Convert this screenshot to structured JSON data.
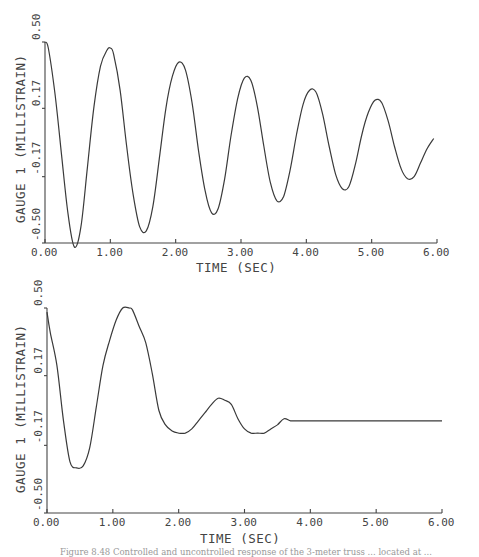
{
  "chart_data": [
    {
      "type": "line",
      "title": "",
      "xlabel": "TIME  (SEC)",
      "ylabel": "GAUGE 1  (MILLISTRAIN)",
      "xlim": [
        0,
        6
      ],
      "ylim": [
        -0.5,
        0.5
      ],
      "xticks": [
        "0.00",
        "1.00",
        "2.00",
        "3.00",
        "4.00",
        "5.00",
        "6.00"
      ],
      "yticks": [
        "-0.50",
        "-0.17",
        "0.17",
        "0.50"
      ],
      "grid": false,
      "legend": null,
      "description": "Uncontrolled response: lightly damped oscillation, period ~1.05 s",
      "series": [
        {
          "name": "Gauge 1 (uncontrolled)",
          "x": [
            0.0,
            0.05,
            0.15,
            0.25,
            0.35,
            0.45,
            0.55,
            0.65,
            0.75,
            0.85,
            0.95,
            1.0,
            1.05,
            1.15,
            1.25,
            1.35,
            1.45,
            1.55,
            1.65,
            1.75,
            1.85,
            1.95,
            2.05,
            2.15,
            2.25,
            2.35,
            2.45,
            2.55,
            2.65,
            2.75,
            2.85,
            2.95,
            3.05,
            3.15,
            3.25,
            3.35,
            3.45,
            3.55,
            3.65,
            3.75,
            3.85,
            3.95,
            4.05,
            4.15,
            4.25,
            4.35,
            4.45,
            4.55,
            4.65,
            4.75,
            4.85,
            4.95,
            5.05,
            5.15,
            5.25,
            5.35,
            5.45,
            5.55,
            5.65,
            5.75,
            5.85,
            5.95
          ],
          "values": [
            0.5,
            0.47,
            0.25,
            -0.05,
            -0.35,
            -0.52,
            -0.42,
            -0.12,
            0.18,
            0.38,
            0.46,
            0.47,
            0.44,
            0.26,
            -0.02,
            -0.26,
            -0.42,
            -0.44,
            -0.32,
            -0.08,
            0.17,
            0.33,
            0.4,
            0.36,
            0.2,
            -0.04,
            -0.24,
            -0.35,
            -0.33,
            -0.18,
            0.04,
            0.22,
            0.32,
            0.31,
            0.18,
            -0.02,
            -0.2,
            -0.29,
            -0.27,
            -0.14,
            0.04,
            0.19,
            0.26,
            0.25,
            0.14,
            -0.02,
            -0.16,
            -0.23,
            -0.22,
            -0.11,
            0.04,
            0.15,
            0.21,
            0.2,
            0.11,
            -0.02,
            -0.13,
            -0.18,
            -0.17,
            -0.1,
            -0.03,
            0.02
          ]
        }
      ]
    },
    {
      "type": "line",
      "title": "",
      "xlabel": "TIME  (SEC)",
      "ylabel": "GAUGE 1  (MILLISTRAIN)",
      "xlim": [
        0,
        6
      ],
      "ylim": [
        -0.5,
        0.5
      ],
      "xticks": [
        "0.00",
        "1.00",
        "2.00",
        "3.00",
        "4.00",
        "5.00",
        "6.00"
      ],
      "yticks": [
        "-0.50",
        "-0.17",
        "0.17",
        "0.50"
      ],
      "grid": false,
      "legend": null,
      "description": "Controlled response: oscillation suppressed, settles near -0.05 after ~3.6 s",
      "series": [
        {
          "name": "Gauge 1 (controlled)",
          "x": [
            0.0,
            0.05,
            0.15,
            0.25,
            0.35,
            0.45,
            0.55,
            0.65,
            0.75,
            0.85,
            0.95,
            1.05,
            1.15,
            1.25,
            1.3,
            1.4,
            1.5,
            1.6,
            1.7,
            1.8,
            1.9,
            2.0,
            2.1,
            2.2,
            2.3,
            2.4,
            2.5,
            2.6,
            2.7,
            2.8,
            2.9,
            3.0,
            3.1,
            3.2,
            3.3,
            3.4,
            3.5,
            3.6,
            3.7,
            3.8,
            4.0,
            4.5,
            5.0,
            5.5,
            6.0
          ],
          "values": [
            0.48,
            0.38,
            0.22,
            -0.05,
            -0.25,
            -0.28,
            -0.27,
            -0.18,
            0.02,
            0.22,
            0.34,
            0.44,
            0.5,
            0.5,
            0.49,
            0.41,
            0.33,
            0.18,
            0.0,
            -0.07,
            -0.1,
            -0.11,
            -0.11,
            -0.09,
            -0.05,
            -0.01,
            0.03,
            0.06,
            0.05,
            0.03,
            -0.04,
            -0.09,
            -0.11,
            -0.11,
            -0.11,
            -0.09,
            -0.07,
            -0.04,
            -0.05,
            -0.05,
            -0.05,
            -0.05,
            -0.05,
            -0.05,
            -0.05
          ]
        }
      ]
    }
  ],
  "plots": [
    {
      "ylabel": "GAUGE 1  (MILLISTRAIN)",
      "xlabel": "TIME  (SEC)",
      "yticks": [
        "0.50",
        "0.17",
        "-0.17",
        "-0.50"
      ],
      "xticks": [
        "0.00",
        "1.00",
        "2.00",
        "3.00",
        "4.00",
        "5.00",
        "6.00"
      ]
    },
    {
      "ylabel": "GAUGE 1  (MILLISTRAIN)",
      "xlabel": "TIME  (SEC)",
      "yticks": [
        "0.50",
        "0.17",
        "-0.17",
        "-0.50"
      ],
      "xticks": [
        "0.00",
        "1.00",
        "2.00",
        "3.00",
        "4.00",
        "5.00",
        "6.00"
      ]
    }
  ],
  "caption": "Figure 8.48   Controlled and uncontrolled response of the 3-meter truss ... located at ..."
}
